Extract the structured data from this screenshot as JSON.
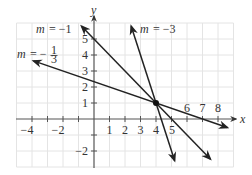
{
  "graph": {
    "x_axis_label": "x",
    "y_axis_label": "y",
    "x_tick_labels": [
      "−4",
      "−2",
      "1",
      "2",
      "3",
      "4",
      "5",
      "6",
      "7",
      "8"
    ],
    "y_tick_labels": [
      "5",
      "4",
      "3",
      "2",
      "1",
      "−2"
    ],
    "intersection_point": {
      "x": 4,
      "y": 1
    },
    "lines": [
      {
        "name": "slope-minus-one",
        "label": "m = −1",
        "slope": -1,
        "equation": "y = -x + 5"
      },
      {
        "name": "slope-minus-three",
        "label": "m = −3",
        "slope": -3,
        "equation": "y = -3x + 13"
      },
      {
        "name": "slope-minus-one-third",
        "label_prefix": "m = −",
        "label_num": "1",
        "label_den": "3",
        "slope": -0.3333,
        "equation": "y = -x/3 + 7/3"
      }
    ],
    "label_m": "m",
    "label_eq_minus1": "= −1",
    "label_eq_minus3": "= −3",
    "label_eq_minus": "= −",
    "colors": {
      "grid": "#e4e4e4",
      "axis": "#555555",
      "line": "#222222"
    }
  }
}
